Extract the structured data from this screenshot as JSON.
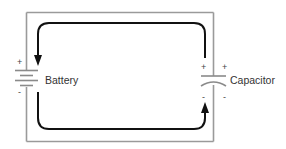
{
  "diagram": {
    "components": [
      {
        "id": "battery",
        "label": "Battery",
        "positive": "+",
        "negative": "-"
      },
      {
        "id": "capacitor",
        "label": "Capacitor",
        "positive_left": "+",
        "positive_right": "+",
        "negative_left": "-",
        "negative_right": "-"
      }
    ],
    "arrows": [
      {
        "id": "top-flow",
        "description": "current from capacitor top plate over to battery top, pointing down into battery +"
      },
      {
        "id": "bottom-flow",
        "description": "current from battery bottom along bottom to capacitor, pointing up into capacitor -"
      }
    ],
    "colors": {
      "wire": "#9a9a9a",
      "arrow": "#111111",
      "text": "#333333"
    }
  }
}
